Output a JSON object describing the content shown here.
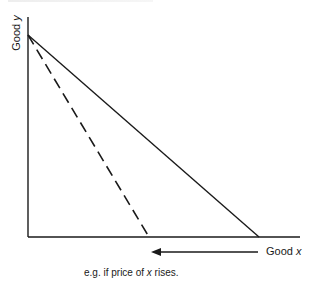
{
  "diagram": {
    "axes": {
      "y_label_prefix": "Good ",
      "y_label_var": "y",
      "x_label_prefix": "Good ",
      "x_label_var": "x"
    },
    "lines": [
      {
        "name": "original-budget-line",
        "style": "solid",
        "from": [
          28,
          35
        ],
        "to": [
          259,
          237
        ]
      },
      {
        "name": "new-budget-line",
        "style": "dashed",
        "from": [
          28,
          35
        ],
        "to": [
          149,
          237
        ]
      }
    ],
    "arrow": {
      "direction": "left",
      "from": [
        258,
        252
      ],
      "to": [
        152,
        252
      ]
    },
    "caption": {
      "prefix": "e.g. if price  of ",
      "var": "x",
      "suffix": " rises."
    },
    "colors": {
      "ink": "#1a1a1a",
      "background": "#ffffff"
    }
  }
}
